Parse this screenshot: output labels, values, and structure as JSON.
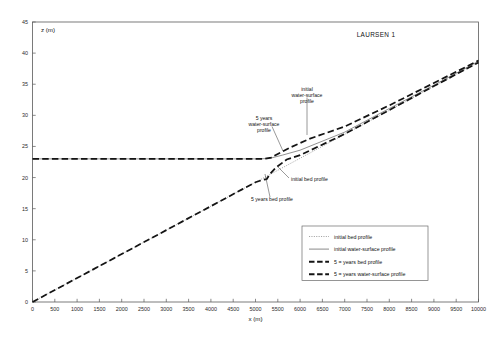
{
  "chart_data": {
    "type": "line",
    "title": "LAURSEN 1",
    "xlabel": "x (m)",
    "ylabel": "z (m)",
    "xlim": [
      0,
      10000
    ],
    "ylim": [
      0,
      45
    ],
    "xtick_step": 500,
    "ytick_step": 5,
    "grid": false,
    "legend_position": "lower-right inside axes",
    "xticks": [
      0,
      500,
      1000,
      1500,
      2000,
      2500,
      3000,
      3500,
      4000,
      4500,
      5000,
      5500,
      6000,
      6500,
      7000,
      7500,
      8000,
      8500,
      9000,
      9500,
      10000
    ],
    "yticks": [
      0,
      5,
      10,
      15,
      20,
      25,
      30,
      35,
      40,
      45
    ],
    "confluence_x": 5300,
    "backwater_level": 23.0,
    "series": [
      {
        "name": "initial bed profile",
        "style": "dotted-light",
        "x": [
          0,
          1000,
          2000,
          3000,
          4000,
          5000,
          5300,
          6000,
          7000,
          8000,
          9000,
          10000
        ],
        "y": [
          0.0,
          3.85,
          7.7,
          11.55,
          15.4,
          19.25,
          20.4,
          23.1,
          26.95,
          30.8,
          34.65,
          38.5
        ]
      },
      {
        "name": "initial water-surface profile",
        "style": "solid-thin",
        "x": [
          0,
          1000,
          2000,
          3000,
          4000,
          5000,
          5300,
          5600,
          6000,
          7000,
          8000,
          9000,
          10000
        ],
        "y": [
          23.0,
          23.0,
          23.0,
          23.0,
          23.0,
          23.0,
          23.05,
          23.6,
          24.4,
          27.3,
          31.1,
          34.85,
          38.7
        ]
      },
      {
        "name": "5 = years bed profile",
        "style": "dashed-heavy",
        "x": [
          0,
          1000,
          2000,
          3000,
          4000,
          4700,
          5000,
          5150,
          5250,
          5330,
          5450,
          5700,
          6000,
          7000,
          8000,
          9000,
          10000
        ],
        "y": [
          0.0,
          3.85,
          7.7,
          11.55,
          15.4,
          18.1,
          19.25,
          19.6,
          19.75,
          20.6,
          21.55,
          22.9,
          23.6,
          27.0,
          30.85,
          34.7,
          38.5
        ]
      },
      {
        "name": "5 = years water-surface profile",
        "style": "dashed-heavy",
        "x": [
          0,
          1000,
          2000,
          3000,
          4000,
          5000,
          5200,
          5350,
          5500,
          5800,
          6200,
          7000,
          8000,
          9000,
          10000
        ],
        "y": [
          23.0,
          23.0,
          23.0,
          23.0,
          23.0,
          23.0,
          23.0,
          23.2,
          23.8,
          24.9,
          26.2,
          28.2,
          31.6,
          35.2,
          38.8
        ]
      }
    ],
    "annotations": [
      {
        "text": "initial water-surface profile",
        "x": 6350,
        "y": 31.8
      },
      {
        "text": "5 years water-surface profile",
        "x": 4450,
        "y": 28.4
      },
      {
        "text": "initial bed profile",
        "x": 6500,
        "y": 20.2
      },
      {
        "text": "5 years bed profile",
        "x": 5450,
        "y": 16.1
      }
    ]
  },
  "legend": {
    "entries": [
      {
        "label": "initial bed profile",
        "key": "initbed"
      },
      {
        "label": "initial water-surface profile",
        "key": "initws"
      },
      {
        "label": "5 = years bed profile",
        "key": "bed5"
      },
      {
        "label": "5 = years water-surface profile",
        "key": "ws5"
      }
    ]
  },
  "annotation_lines": {
    "initial_water_surface": [
      "initial",
      "water-surface",
      "profile"
    ],
    "five_years_water_surface": [
      "5 years",
      "water-surface",
      "profile"
    ],
    "initial_bed": "initial bed profile",
    "five_years_bed": "5 years bed profile"
  }
}
